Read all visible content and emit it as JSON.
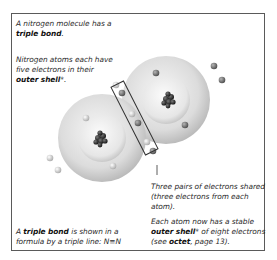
{
  "captions": {
    "intro": {
      "prefix": "A nitrogen molecule has a",
      "bold": "triple bond",
      "suffix": "."
    },
    "outer_shell": {
      "line1": "Nitrogen atoms each have",
      "line2": "five electrons in their",
      "bold": "outer shell",
      "suffix": "*."
    },
    "shared": {
      "line1": "Three pairs of electrons shared",
      "line2": "(three electrons from each atom)."
    },
    "formula": {
      "prefix": "A",
      "bold": "triple bond",
      "line1_suffix": "is shown in a",
      "line2": "formula by a triple line: N≡N"
    },
    "stable": {
      "line1": "Each atom now has a stable",
      "bold": "outer shell",
      "line2_suffix": "* of eight electrons",
      "line3_prefix": "(see",
      "line3_bold": "octet",
      "line3_suffix": ", page 13)."
    }
  },
  "diagram": {
    "molecule": "N2",
    "atoms": 2,
    "shared_electron_pairs": 3,
    "colors": {
      "frame": "#5a5a5a",
      "shell": "#d8d8d8",
      "nucleus": "#2a2a2a",
      "electron_light": "#cfcfcf",
      "electron_dark": "#6e6e6e"
    }
  }
}
